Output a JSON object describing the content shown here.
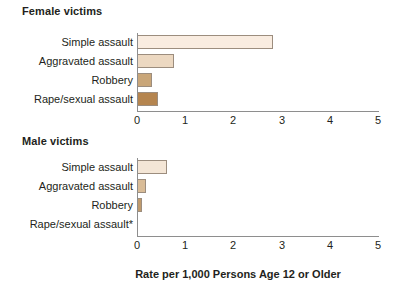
{
  "chart_data": {
    "type": "bar",
    "title": "",
    "xlabel": "Rate per 1,000 Persons Age 12 or Older",
    "ylabel": "",
    "xlim": [
      0,
      5
    ],
    "xticks": [
      "0",
      "1",
      "2",
      "3",
      "4",
      "5"
    ],
    "orientation": "horizontal",
    "grid": false,
    "legend": "none",
    "panels": [
      {
        "title": "Female victims",
        "categories": [
          "Simple assault",
          "Aggravated assault",
          "Robbery",
          "Rape/sexual assault"
        ],
        "values": [
          2.8,
          0.77,
          0.3,
          0.44
        ],
        "colors": [
          "#f9ece0",
          "#ecd8c1",
          "#c9a679",
          "#b5854f"
        ]
      },
      {
        "title": "Male victims",
        "categories": [
          "Simple assault",
          "Aggravated assault",
          "Robbery",
          "Rape/sexual assault*"
        ],
        "values": [
          0.63,
          0.18,
          0.1,
          0.0
        ],
        "colors": [
          "#f4e6d6",
          "#d9bc97",
          "#bf9a6c",
          "#b5854f"
        ]
      }
    ]
  },
  "axis": {
    "bar_border_color": "#9c8d7e",
    "axis_line_color": "#8e8e8e",
    "text_color": "#231f20"
  }
}
